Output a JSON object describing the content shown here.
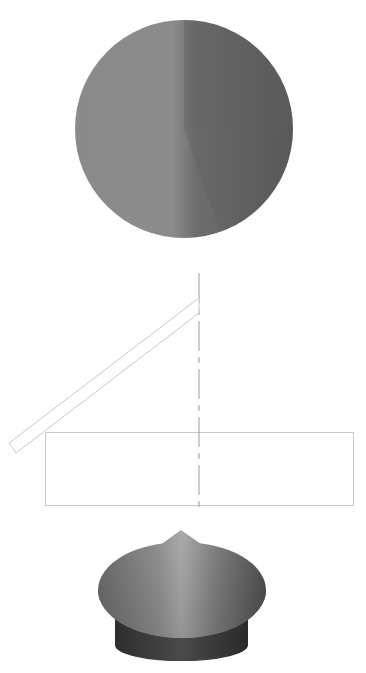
{
  "figure": {
    "views": [
      {
        "name": "top-view",
        "description": "Cone viewed from above (shaded disk with apex at center)"
      },
      {
        "name": "section-view",
        "description": "Side elevation: rectangular base with dashed centerline and inclined strip"
      },
      {
        "name": "perspective-view",
        "description": "3D rendering of conical cap on cylindrical base"
      }
    ],
    "colors": {
      "background": "#ffffff",
      "line": "#c8c8c8",
      "centerline": "#9a9a9a",
      "shade_light": "#a8a8a8",
      "shade_mid": "#7d7d7d",
      "shade_dark": "#555555",
      "base_dark": "#3a3a3a"
    }
  }
}
